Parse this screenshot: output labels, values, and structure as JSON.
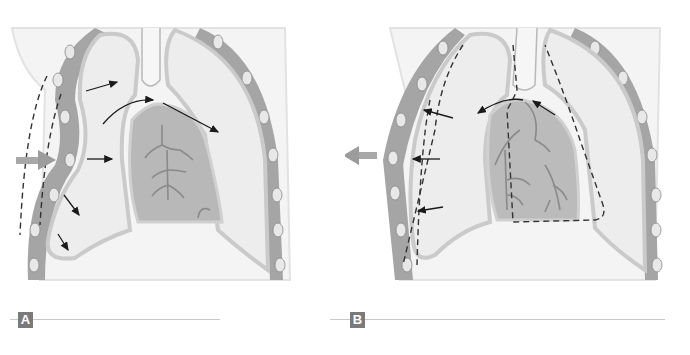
{
  "figure": {
    "colors": {
      "background": "#ffffff",
      "body_outline": "#e6e6e6",
      "chest_wall": "#9a9a9a",
      "lung_fill": "#ececec",
      "pleura": "#cfcfcf",
      "heart_fill": "#b5b5b5",
      "vessels": "#8a8a8a",
      "arrow": "#1a1a1a",
      "big_arrow": "#9c9c9c",
      "label_box": "#7a7a7a",
      "label_text": "#ffffff",
      "caption_line": "#c8c8c8"
    }
  },
  "panels": [
    {
      "id": "A",
      "label": "A",
      "external_arrow": "pointing inward (right) toward chest wall",
      "dashed_outline": "left chest wall, displaced outward",
      "small_arrows": 6
    },
    {
      "id": "B",
      "label": "B",
      "external_arrow": "pointing outward (left) away from chest wall",
      "dashed_outline": "left lung collapsed border and right lung/mediastinum border",
      "small_arrows": 5
    }
  ]
}
